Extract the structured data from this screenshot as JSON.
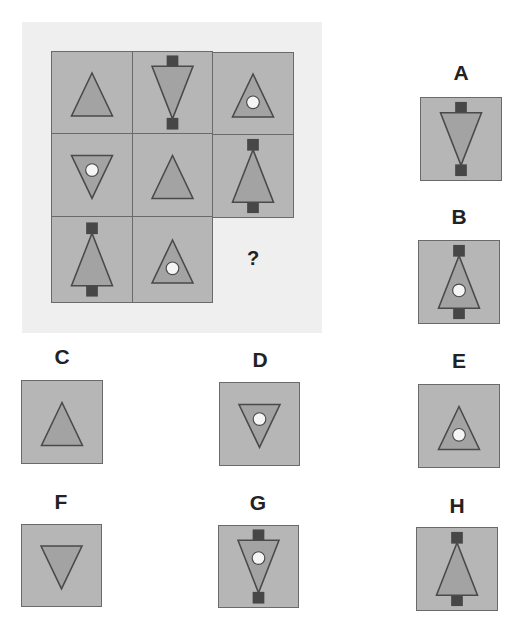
{
  "colors": {
    "panel_bg": "#efefef",
    "tile_bg": "#b6b6b6",
    "tile_border": "#6a6a6a",
    "triangle_fill": "#a3a3a3",
    "triangle_stroke": "#4a4a4a",
    "square_fill": "#474747",
    "circle_fill": "#f5f5f5"
  },
  "puzzle": {
    "question_mark": "?",
    "cells": [
      {
        "row": 0,
        "col": 0,
        "x": 51,
        "y": 51,
        "w": 82,
        "h": 83,
        "triangle": "up",
        "circle": false,
        "squares": false
      },
      {
        "row": 0,
        "col": 1,
        "x": 132,
        "y": 51,
        "w": 81,
        "h": 83,
        "triangle": "down",
        "circle": false,
        "squares": true
      },
      {
        "row": 0,
        "col": 2,
        "x": 212,
        "y": 52,
        "w": 82,
        "h": 83,
        "triangle": "up",
        "circle": true,
        "squares": false
      },
      {
        "row": 1,
        "col": 0,
        "x": 51,
        "y": 133,
        "w": 82,
        "h": 84,
        "triangle": "down",
        "circle": true,
        "squares": false
      },
      {
        "row": 1,
        "col": 1,
        "x": 132,
        "y": 133,
        "w": 81,
        "h": 84,
        "triangle": "up",
        "circle": false,
        "squares": false
      },
      {
        "row": 1,
        "col": 2,
        "x": 212,
        "y": 134,
        "w": 82,
        "h": 84,
        "triangle": "up",
        "circle": false,
        "squares": true
      },
      {
        "row": 2,
        "col": 0,
        "x": 51,
        "y": 216,
        "w": 82,
        "h": 87,
        "triangle": "up",
        "circle": false,
        "squares": true
      },
      {
        "row": 2,
        "col": 1,
        "x": 132,
        "y": 216,
        "w": 81,
        "h": 87,
        "triangle": "up",
        "circle": true,
        "squares": false
      }
    ],
    "missing": {
      "row": 2,
      "col": 2,
      "x": 212,
      "y": 217,
      "w": 82,
      "h": 86
    }
  },
  "options": [
    {
      "label": "A",
      "x": 420,
      "y": 97,
      "w": 82,
      "h": 84,
      "lx": 441,
      "ly": 61,
      "triangle": "down",
      "circle": false,
      "squares": true
    },
    {
      "label": "B",
      "x": 418,
      "y": 240,
      "w": 82,
      "h": 84,
      "lx": 439,
      "ly": 205,
      "triangle": "up",
      "circle": true,
      "squares": true
    },
    {
      "label": "C",
      "x": 21,
      "y": 380,
      "w": 82,
      "h": 84,
      "lx": 42,
      "ly": 345,
      "triangle": "up",
      "circle": false,
      "squares": false
    },
    {
      "label": "D",
      "x": 219,
      "y": 382,
      "w": 81,
      "h": 84,
      "lx": 240,
      "ly": 348,
      "triangle": "down",
      "circle": true,
      "squares": false
    },
    {
      "label": "E",
      "x": 418,
      "y": 384,
      "w": 82,
      "h": 84,
      "lx": 439,
      "ly": 349,
      "triangle": "up",
      "circle": true,
      "squares": false
    },
    {
      "label": "F",
      "x": 21,
      "y": 524,
      "w": 81,
      "h": 83,
      "lx": 41,
      "ly": 490,
      "triangle": "down",
      "circle": false,
      "squares": false
    },
    {
      "label": "G",
      "x": 218,
      "y": 525,
      "w": 81,
      "h": 83,
      "lx": 238,
      "ly": 491,
      "triangle": "down",
      "circle": true,
      "squares": true
    },
    {
      "label": "H",
      "x": 416,
      "y": 527,
      "w": 82,
      "h": 84,
      "lx": 437,
      "ly": 494,
      "triangle": "up",
      "circle": false,
      "squares": true
    }
  ]
}
